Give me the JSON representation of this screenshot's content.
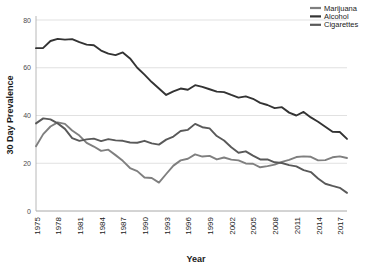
{
  "chart_data": {
    "type": "line",
    "title": "",
    "xlabel": "Year",
    "ylabel": "30 Day Prevalence",
    "xlim": [
      1975,
      2018
    ],
    "ylim": [
      0,
      80
    ],
    "yticks": [
      0,
      20,
      40,
      60,
      80
    ],
    "xticks": [
      1975,
      1978,
      1981,
      1984,
      1987,
      1990,
      1993,
      1996,
      1999,
      2002,
      2005,
      2008,
      2011,
      2014,
      2017
    ],
    "grid": true,
    "legend_position": "top-right",
    "x": [
      1975,
      1976,
      1977,
      1978,
      1979,
      1980,
      1981,
      1982,
      1983,
      1984,
      1985,
      1986,
      1987,
      1988,
      1989,
      1990,
      1991,
      1992,
      1993,
      1994,
      1995,
      1996,
      1997,
      1998,
      1999,
      2000,
      2001,
      2002,
      2003,
      2004,
      2005,
      2006,
      2007,
      2008,
      2009,
      2010,
      2011,
      2012,
      2013,
      2014,
      2015,
      2016,
      2017,
      2018
    ],
    "series": [
      {
        "name": "Marijuana",
        "color": "#7f7f7f",
        "values": [
          27.1,
          32.2,
          35.4,
          37.1,
          36.5,
          33.7,
          31.6,
          28.5,
          27.0,
          25.2,
          25.7,
          23.4,
          21.0,
          18.0,
          16.7,
          14.0,
          13.8,
          11.9,
          15.5,
          19.0,
          21.2,
          21.9,
          23.7,
          22.8,
          23.1,
          21.6,
          22.4,
          21.5,
          21.2,
          19.9,
          19.8,
          18.3,
          18.8,
          19.4,
          20.6,
          21.4,
          22.6,
          22.9,
          22.7,
          21.2,
          21.3,
          22.5,
          22.9,
          22.2
        ]
      },
      {
        "name": "Alcohol",
        "color": "#333333",
        "values": [
          68.2,
          68.3,
          71.2,
          72.1,
          71.8,
          72.0,
          70.7,
          69.7,
          69.4,
          67.2,
          65.9,
          65.3,
          66.4,
          63.9,
          60.0,
          57.1,
          54.0,
          51.3,
          48.6,
          50.1,
          51.3,
          50.8,
          52.7,
          52.0,
          51.0,
          50.0,
          49.8,
          48.6,
          47.5,
          48.0,
          47.0,
          45.3,
          44.4,
          43.1,
          43.5,
          41.2,
          40.0,
          41.5,
          39.2,
          37.4,
          35.3,
          33.2,
          33.1,
          30.2
        ]
      },
      {
        "name": "Cigarettes",
        "color": "#595959",
        "values": [
          36.7,
          38.8,
          38.4,
          36.7,
          34.4,
          30.5,
          29.4,
          30.0,
          30.3,
          29.3,
          30.1,
          29.6,
          29.4,
          28.7,
          28.6,
          29.4,
          28.3,
          27.8,
          29.9,
          31.2,
          33.5,
          34.0,
          36.5,
          35.1,
          34.6,
          31.4,
          29.5,
          26.7,
          24.4,
          25.0,
          23.2,
          21.6,
          21.6,
          20.4,
          20.1,
          19.2,
          18.7,
          17.1,
          16.3,
          13.6,
          11.4,
          10.5,
          9.7,
          7.6
        ]
      }
    ]
  },
  "legend": {
    "items": [
      {
        "label": "Marijuana"
      },
      {
        "label": "Alcohol"
      },
      {
        "label": "Cigarettes"
      }
    ]
  },
  "axes": {
    "ylabel": "30 Day Prevalence",
    "xlabel": "Year"
  }
}
